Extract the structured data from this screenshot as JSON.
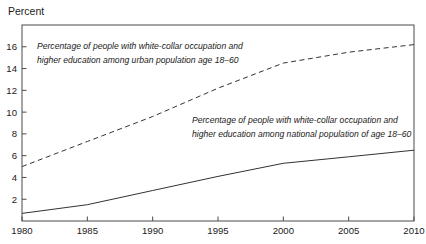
{
  "chart_data": {
    "type": "line",
    "title": "",
    "ylabel": "Percent",
    "xlabel": "",
    "x": [
      1980,
      1985,
      1990,
      1995,
      2000,
      2005,
      2010
    ],
    "x_tick_labels": [
      "1980",
      "1985",
      "1990",
      "1995",
      "2000",
      "2005",
      "2010"
    ],
    "series": [
      {
        "name": "urban",
        "style": "dashed",
        "values": [
          5.0,
          7.3,
          9.6,
          12.2,
          14.5,
          15.5,
          16.2
        ]
      },
      {
        "name": "national",
        "style": "solid",
        "values": [
          0.7,
          1.5,
          2.8,
          4.1,
          5.3,
          5.9,
          6.5
        ]
      }
    ],
    "ylim": [
      0,
      18
    ],
    "xlim": [
      1980,
      2010
    ],
    "yticks": [
      2,
      4,
      6,
      8,
      10,
      12,
      14,
      16
    ],
    "grid": false,
    "legend_position": "none",
    "line_color": "#333333",
    "border_color": "#4a4a4a",
    "annotations": [
      {
        "name": "urban-annotation",
        "line1": "Percentage of people with white-collar occupation and",
        "line2": "higher education among urban population age 18–60"
      },
      {
        "name": "national-annotation",
        "line1": "Percentage of people with white-collar occupation and",
        "line2": "higher education among national population of age 18–60"
      }
    ]
  }
}
